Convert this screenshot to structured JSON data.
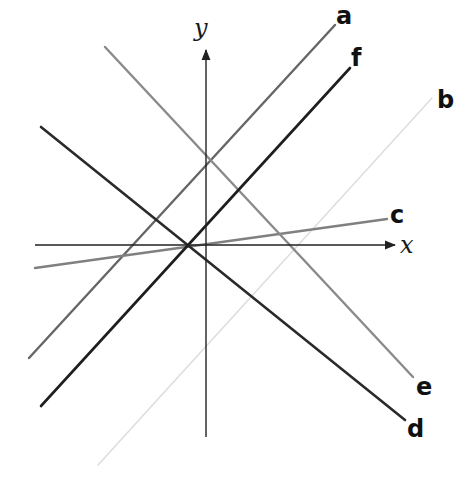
{
  "diagram": {
    "axes": {
      "x_label": "x",
      "y_label": "y",
      "color": "#222222",
      "x_axis": {
        "x1": 35,
        "y1": 245,
        "x2": 395,
        "y2": 245
      },
      "y_axis": {
        "x1": 206,
        "y1": 437,
        "x2": 206,
        "y2": 50
      },
      "x_label_pos": {
        "x": 400,
        "y": 253
      },
      "y_label_pos": {
        "x": 194,
        "y": 36
      }
    },
    "lines": [
      {
        "id": "a",
        "label": "a",
        "color": "#666666",
        "width": 2.4,
        "x1": 29,
        "y1": 358,
        "x2": 335,
        "y2": 25,
        "label_x": 336,
        "label_y": 24
      },
      {
        "id": "b",
        "label": "b",
        "color": "#dcdcdc",
        "width": 1.4,
        "x1": 98,
        "y1": 465,
        "x2": 432,
        "y2": 98,
        "label_x": 437,
        "label_y": 108
      },
      {
        "id": "c",
        "label": "c",
        "color": "#808080",
        "width": 2.4,
        "x1": 35,
        "y1": 268,
        "x2": 387,
        "y2": 219,
        "label_x": 390,
        "label_y": 223
      },
      {
        "id": "d",
        "label": "d",
        "color": "#2a2a2a",
        "width": 2.6,
        "x1": 41,
        "y1": 127,
        "x2": 405,
        "y2": 420,
        "label_x": 407,
        "label_y": 437
      },
      {
        "id": "e",
        "label": "e",
        "color": "#8a8a8a",
        "width": 2.4,
        "x1": 105,
        "y1": 47,
        "x2": 413,
        "y2": 377,
        "label_x": 416,
        "label_y": 395
      },
      {
        "id": "f",
        "label": "f",
        "color": "#1e1e1e",
        "width": 2.6,
        "x1": 41,
        "y1": 406,
        "x2": 350,
        "y2": 68,
        "label_x": 351,
        "label_y": 66
      }
    ]
  }
}
